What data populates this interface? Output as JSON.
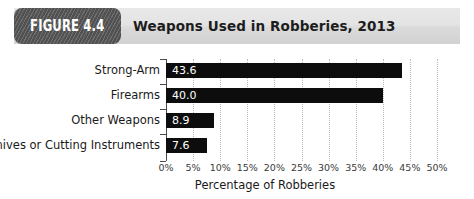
{
  "figure": {
    "badge_label": "FIGURE 4.4",
    "title": "Weapons Used in Robberies, 2013"
  },
  "colors": {
    "bar": "#0d0d0d",
    "badge_bg": "#5a5a5a",
    "header_bg": "#e4e4e4",
    "gridline": "#b9b9b9",
    "axis": "#4a4a4a",
    "value_label": "#ffffff"
  },
  "chart_data": {
    "type": "bar",
    "orientation": "horizontal",
    "title": "Weapons Used in Robberies, 2013",
    "categories": [
      "Strong-Arm",
      "Firearms",
      "Other Weapons",
      "Knives or Cutting Instruments"
    ],
    "values": [
      43.6,
      40.0,
      8.9,
      7.6
    ],
    "value_labels": [
      "43.6",
      "40.0",
      "8.9",
      "7.6"
    ],
    "xlabel": "Percentage of Robberies",
    "ylabel": "",
    "xlim": [
      0,
      50
    ],
    "xtick_values": [
      0,
      5,
      10,
      15,
      20,
      25,
      30,
      35,
      40,
      45,
      50
    ],
    "xtick_labels": [
      "0%",
      "5%",
      "10%",
      "15%",
      "20%",
      "25%",
      "30%",
      "35%",
      "40%",
      "45%",
      "50%"
    ],
    "grid": "vertical-dotted",
    "legend": "none"
  }
}
